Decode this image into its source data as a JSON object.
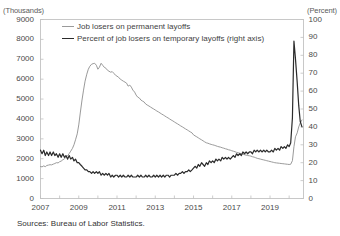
{
  "figure": {
    "title_partial": "",
    "source_note": "Sources: Bureau of Labor Statistics.",
    "unit_left": "(Thousands)",
    "unit_right": "(Percent)",
    "colors": {
      "permanent_line": "#9a9a9a",
      "temporary_line": "#2b2b2b",
      "frame": "#c8c8c8",
      "text": "#3b3b3b"
    }
  },
  "legend": {
    "position": "top-left-inside",
    "items": [
      {
        "label": "Job losers on permanent layoffs",
        "color": "#9a9a9a",
        "axis": "left"
      },
      {
        "label": "Percent of job losers on temporary layoffs (right axis)",
        "color": "#2b2b2b",
        "axis": "right"
      }
    ]
  },
  "chart_data": {
    "type": "line",
    "title": "",
    "xlabel": "",
    "ylabel": "(Thousands)",
    "y2label": "(Percent)",
    "grid": false,
    "xlim": [
      2007.0,
      2020.75
    ],
    "ylim": [
      0,
      9000
    ],
    "y2lim": [
      0,
      100
    ],
    "yticks": [
      0,
      1000,
      2000,
      3000,
      4000,
      5000,
      6000,
      7000,
      8000,
      9000
    ],
    "ytick_labels": [
      "0",
      "1000",
      "2000",
      "3000",
      "4000",
      "5000",
      "6000",
      "7000",
      "8000",
      "9000"
    ],
    "y2ticks": [
      0,
      10,
      20,
      30,
      40,
      50,
      60,
      70,
      80,
      90,
      100
    ],
    "y2tick_labels": [
      "0",
      "10",
      "20",
      "30",
      "40",
      "50",
      "60",
      "70",
      "80",
      "90",
      "100"
    ],
    "xticks": [
      2007,
      2009,
      2011,
      2013,
      2015,
      2017,
      2019
    ],
    "xtick_labels": [
      "2007",
      "2009",
      "2011",
      "2013",
      "2015",
      "2017",
      "2019"
    ],
    "series": [
      {
        "name": "Job losers on permanent layoffs",
        "axis": "left",
        "units": "thousands",
        "color": "#9a9a9a",
        "x": [
          2007.0,
          2007.08,
          2007.17,
          2007.25,
          2007.33,
          2007.42,
          2007.5,
          2007.58,
          2007.67,
          2007.75,
          2007.83,
          2007.92,
          2008.0,
          2008.08,
          2008.17,
          2008.25,
          2008.33,
          2008.42,
          2008.5,
          2008.58,
          2008.67,
          2008.75,
          2008.83,
          2008.92,
          2009.0,
          2009.08,
          2009.17,
          2009.25,
          2009.33,
          2009.42,
          2009.5,
          2009.58,
          2009.67,
          2009.75,
          2009.83,
          2009.92,
          2010.0,
          2010.08,
          2010.17,
          2010.25,
          2010.33,
          2010.42,
          2010.5,
          2010.58,
          2010.67,
          2010.75,
          2010.83,
          2010.92,
          2011.0,
          2011.08,
          2011.17,
          2011.25,
          2011.33,
          2011.42,
          2011.5,
          2011.58,
          2011.67,
          2011.75,
          2011.83,
          2011.92,
          2012.0,
          2012.08,
          2012.17,
          2012.25,
          2012.33,
          2012.42,
          2012.5,
          2012.58,
          2012.67,
          2012.75,
          2012.83,
          2012.92,
          2013.0,
          2013.08,
          2013.17,
          2013.25,
          2013.33,
          2013.42,
          2013.5,
          2013.58,
          2013.67,
          2013.75,
          2013.83,
          2013.92,
          2014.0,
          2014.08,
          2014.17,
          2014.25,
          2014.33,
          2014.42,
          2014.5,
          2014.58,
          2014.67,
          2014.75,
          2014.83,
          2014.92,
          2015.0,
          2015.08,
          2015.17,
          2015.25,
          2015.33,
          2015.42,
          2015.5,
          2015.58,
          2015.67,
          2015.75,
          2015.83,
          2015.92,
          2016.0,
          2016.08,
          2016.17,
          2016.25,
          2016.33,
          2016.42,
          2016.5,
          2016.58,
          2016.67,
          2016.75,
          2016.83,
          2016.92,
          2017.0,
          2017.08,
          2017.17,
          2017.25,
          2017.33,
          2017.42,
          2017.5,
          2017.58,
          2017.67,
          2017.75,
          2017.83,
          2017.92,
          2018.0,
          2018.08,
          2018.17,
          2018.25,
          2018.33,
          2018.42,
          2018.5,
          2018.58,
          2018.67,
          2018.75,
          2018.83,
          2018.92,
          2019.0,
          2019.08,
          2019.17,
          2019.25,
          2019.33,
          2019.42,
          2019.5,
          2019.58,
          2019.67,
          2019.75,
          2019.83,
          2019.92,
          2020.0,
          2020.08,
          2020.17,
          2020.25,
          2020.33,
          2020.42,
          2020.5,
          2020.58,
          2020.67
        ],
        "values": [
          1610,
          1590,
          1640,
          1600,
          1660,
          1680,
          1700,
          1690,
          1730,
          1760,
          1800,
          1790,
          1850,
          1880,
          1950,
          1990,
          2080,
          2150,
          2260,
          2380,
          2520,
          2700,
          2950,
          3250,
          3700,
          4300,
          4950,
          5450,
          5900,
          6250,
          6500,
          6650,
          6750,
          6780,
          6800,
          6700,
          6500,
          6600,
          6800,
          6700,
          6600,
          6550,
          6450,
          6400,
          6350,
          6380,
          6300,
          6200,
          6150,
          6100,
          6000,
          5950,
          5900,
          5850,
          5800,
          5650,
          5700,
          5600,
          5450,
          5350,
          5200,
          5100,
          5050,
          4950,
          4900,
          4850,
          4750,
          4700,
          4650,
          4600,
          4550,
          4500,
          4450,
          4400,
          4350,
          4300,
          4250,
          4200,
          4150,
          4100,
          4050,
          4000,
          3950,
          3900,
          3850,
          3800,
          3750,
          3700,
          3650,
          3600,
          3550,
          3500,
          3450,
          3400,
          3350,
          3300,
          3200,
          3150,
          3100,
          3050,
          3000,
          2950,
          2900,
          2850,
          2800,
          2780,
          2750,
          2720,
          2700,
          2680,
          2650,
          2620,
          2600,
          2580,
          2550,
          2530,
          2500,
          2480,
          2450,
          2430,
          2400,
          2380,
          2350,
          2320,
          2300,
          2280,
          2250,
          2230,
          2200,
          2180,
          2160,
          2150,
          2130,
          2100,
          2080,
          2050,
          2020,
          2000,
          1980,
          1960,
          1940,
          1920,
          1900,
          1880,
          1860,
          1840,
          1820,
          1800,
          1790,
          1780,
          1770,
          1760,
          1750,
          1740,
          1730,
          1720,
          1710,
          1720,
          1900,
          2600,
          3100,
          3300,
          3600,
          3800,
          3950
        ]
      },
      {
        "name": "Percent of job losers on temporary layoffs",
        "axis": "right",
        "units": "percent",
        "color": "#2b2b2b",
        "x": [
          2007.0,
          2007.08,
          2007.17,
          2007.25,
          2007.33,
          2007.42,
          2007.5,
          2007.58,
          2007.67,
          2007.75,
          2007.83,
          2007.92,
          2008.0,
          2008.08,
          2008.17,
          2008.25,
          2008.33,
          2008.42,
          2008.5,
          2008.58,
          2008.67,
          2008.75,
          2008.83,
          2008.92,
          2009.0,
          2009.08,
          2009.17,
          2009.25,
          2009.33,
          2009.42,
          2009.5,
          2009.58,
          2009.67,
          2009.75,
          2009.83,
          2009.92,
          2010.0,
          2010.08,
          2010.17,
          2010.25,
          2010.33,
          2010.42,
          2010.5,
          2010.58,
          2010.67,
          2010.75,
          2010.83,
          2010.92,
          2011.0,
          2011.08,
          2011.17,
          2011.25,
          2011.33,
          2011.42,
          2011.5,
          2011.58,
          2011.67,
          2011.75,
          2011.83,
          2011.92,
          2012.0,
          2012.08,
          2012.17,
          2012.25,
          2012.33,
          2012.42,
          2012.5,
          2012.58,
          2012.67,
          2012.75,
          2012.83,
          2012.92,
          2013.0,
          2013.08,
          2013.17,
          2013.25,
          2013.33,
          2013.42,
          2013.5,
          2013.58,
          2013.67,
          2013.75,
          2013.83,
          2013.92,
          2014.0,
          2014.08,
          2014.17,
          2014.25,
          2014.33,
          2014.42,
          2014.5,
          2014.58,
          2014.67,
          2014.75,
          2014.83,
          2014.92,
          2015.0,
          2015.08,
          2015.17,
          2015.25,
          2015.33,
          2015.42,
          2015.5,
          2015.58,
          2015.67,
          2015.75,
          2015.83,
          2015.92,
          2016.0,
          2016.08,
          2016.17,
          2016.25,
          2016.33,
          2016.42,
          2016.5,
          2016.58,
          2016.67,
          2016.75,
          2016.83,
          2016.92,
          2017.0,
          2017.08,
          2017.17,
          2017.25,
          2017.33,
          2017.42,
          2017.5,
          2017.58,
          2017.67,
          2017.75,
          2017.83,
          2017.92,
          2018.0,
          2018.08,
          2018.17,
          2018.25,
          2018.33,
          2018.42,
          2018.5,
          2018.58,
          2018.67,
          2018.75,
          2018.83,
          2018.92,
          2019.0,
          2019.08,
          2019.17,
          2019.25,
          2019.33,
          2019.42,
          2019.5,
          2019.58,
          2019.67,
          2019.75,
          2019.83,
          2019.92,
          2020.0,
          2020.08,
          2020.17,
          2020.25,
          2020.33,
          2020.42,
          2020.5,
          2020.58,
          2020.67
        ],
        "values": [
          27,
          25,
          27,
          24,
          26,
          24,
          26,
          24,
          26,
          24,
          25,
          23,
          25,
          23,
          25,
          23,
          24,
          22,
          24,
          22,
          23,
          21,
          22,
          20,
          20,
          19,
          18,
          17,
          16,
          16,
          15,
          15,
          14,
          15,
          14,
          15,
          14,
          15,
          13,
          14,
          13,
          14,
          13,
          14,
          12,
          13,
          12,
          13,
          13,
          12,
          13,
          12,
          13,
          12,
          12,
          13,
          12,
          13,
          12,
          12,
          12,
          13,
          12,
          13,
          12,
          12,
          13,
          12,
          13,
          12,
          12,
          13,
          12,
          13,
          12,
          13,
          12,
          13,
          12,
          13,
          13,
          12,
          13,
          13,
          13,
          14,
          13,
          14,
          14,
          15,
          14,
          15,
          15,
          16,
          15,
          16,
          17,
          18,
          17,
          19,
          18,
          20,
          19,
          18,
          20,
          19,
          21,
          20,
          21,
          20,
          22,
          21,
          22,
          21,
          23,
          22,
          23,
          22,
          23,
          22,
          23,
          24,
          23,
          25,
          24,
          25,
          24,
          26,
          25,
          26,
          25,
          26,
          26,
          25,
          27,
          26,
          27,
          26,
          27,
          26,
          27,
          26,
          27,
          26,
          26,
          27,
          26,
          28,
          27,
          28,
          27,
          29,
          28,
          29,
          28,
          30,
          29,
          31,
          45,
          88,
          78,
          65,
          52,
          43,
          40
        ]
      }
    ],
    "annotations": [
      {
        "text": "COVID-19 spike in temporary layoffs reaching ~88%",
        "x": 2020.25,
        "series": "Percent of job losers on temporary layoffs"
      }
    ]
  }
}
